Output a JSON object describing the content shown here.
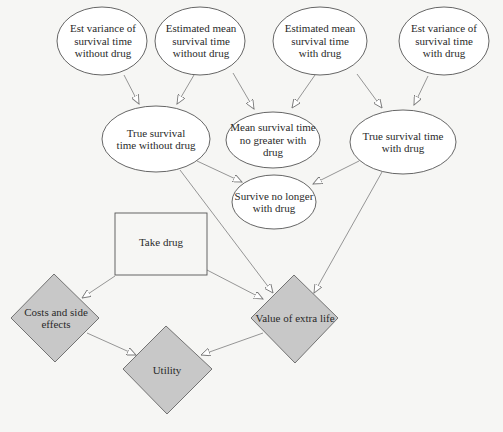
{
  "diagram": {
    "type": "influence-diagram",
    "colors": {
      "background": "#f6f6f4",
      "chance_fill": "#ffffff",
      "value_fill": "#c8c8c8",
      "decision_fill": "#f6f6f4",
      "stroke": "#555555",
      "edge": "#7a7a7a"
    },
    "nodes": {
      "est_var_without": {
        "label": "Est variance of survival time without drug",
        "shape": "ellipse"
      },
      "est_mean_without": {
        "label": "Estimated mean survival time without drug",
        "shape": "ellipse"
      },
      "est_mean_with": {
        "label": "Estimated mean survival time with drug",
        "shape": "ellipse"
      },
      "est_var_with": {
        "label": "Est variance of survival time with drug",
        "shape": "ellipse"
      },
      "true_without": {
        "label": "True survival time without drug",
        "shape": "ellipse"
      },
      "mean_no_greater": {
        "label": "Mean survival time no greater with drug",
        "shape": "ellipse"
      },
      "true_with": {
        "label": "True survival time with drug",
        "shape": "ellipse"
      },
      "survive_no_longer": {
        "label": "Survive no longer with drug",
        "shape": "ellipse"
      },
      "take_drug": {
        "label": "Take drug",
        "shape": "rectangle"
      },
      "costs": {
        "label": "Costs and side effects",
        "shape": "diamond"
      },
      "utility": {
        "label": "Utility",
        "shape": "diamond"
      },
      "value_extra_life": {
        "label": "Value of extra life",
        "shape": "diamond"
      }
    },
    "edges": [
      {
        "from": "est_var_without",
        "to": "true_without"
      },
      {
        "from": "est_mean_without",
        "to": "true_without"
      },
      {
        "from": "est_mean_without",
        "to": "mean_no_greater"
      },
      {
        "from": "est_mean_with",
        "to": "mean_no_greater"
      },
      {
        "from": "est_mean_with",
        "to": "true_with"
      },
      {
        "from": "est_var_with",
        "to": "true_with"
      },
      {
        "from": "true_without",
        "to": "survive_no_longer"
      },
      {
        "from": "true_with",
        "to": "survive_no_longer"
      },
      {
        "from": "true_without",
        "to": "value_extra_life"
      },
      {
        "from": "true_with",
        "to": "value_extra_life"
      },
      {
        "from": "take_drug",
        "to": "value_extra_life"
      },
      {
        "from": "take_drug",
        "to": "costs"
      },
      {
        "from": "costs",
        "to": "utility"
      },
      {
        "from": "value_extra_life",
        "to": "utility"
      }
    ]
  }
}
